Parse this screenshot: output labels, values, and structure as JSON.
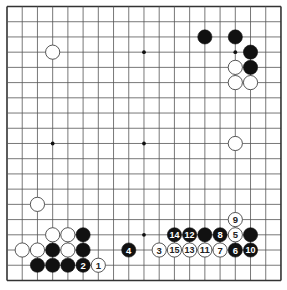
{
  "board": {
    "size": 19,
    "origin_x": 7,
    "origin_y": 6.5,
    "spacing": 15.22,
    "line_color": "#555555",
    "border_color": "#333333",
    "background": "#ffffff",
    "star_points": [
      [
        3,
        3
      ],
      [
        3,
        9
      ],
      [
        3,
        15
      ],
      [
        9,
        3
      ],
      [
        9,
        9
      ],
      [
        9,
        15
      ],
      [
        15,
        3
      ],
      [
        15,
        9
      ],
      [
        15,
        15
      ]
    ]
  },
  "colors": {
    "black_stone": "#111111",
    "white_stone": "#ffffff",
    "white_stroke": "#444444",
    "black_label": "#ffffff",
    "white_label": "#222222"
  },
  "stones": [
    {
      "color": "black",
      "x": 13,
      "y": 2,
      "label": ""
    },
    {
      "color": "black",
      "x": 15,
      "y": 2,
      "label": ""
    },
    {
      "color": "black",
      "x": 16,
      "y": 3,
      "label": ""
    },
    {
      "color": "black",
      "x": 16,
      "y": 4,
      "label": ""
    },
    {
      "color": "white",
      "x": 15,
      "y": 4,
      "label": ""
    },
    {
      "color": "white",
      "x": 15,
      "y": 5,
      "label": ""
    },
    {
      "color": "white",
      "x": 16,
      "y": 5,
      "label": ""
    },
    {
      "color": "white",
      "x": 3,
      "y": 3,
      "label": ""
    },
    {
      "color": "white",
      "x": 15,
      "y": 9,
      "label": ""
    },
    {
      "color": "white",
      "x": 2,
      "y": 13,
      "label": ""
    },
    {
      "color": "white",
      "x": 3,
      "y": 15,
      "label": ""
    },
    {
      "color": "white",
      "x": 4,
      "y": 15,
      "label": ""
    },
    {
      "color": "black",
      "x": 5,
      "y": 15,
      "label": ""
    },
    {
      "color": "white",
      "x": 1,
      "y": 16,
      "label": ""
    },
    {
      "color": "white",
      "x": 2,
      "y": 16,
      "label": ""
    },
    {
      "color": "black",
      "x": 3,
      "y": 16,
      "label": ""
    },
    {
      "color": "white",
      "x": 4,
      "y": 16,
      "label": ""
    },
    {
      "color": "black",
      "x": 5,
      "y": 16,
      "label": ""
    },
    {
      "color": "black",
      "x": 2,
      "y": 17,
      "label": ""
    },
    {
      "color": "black",
      "x": 3,
      "y": 17,
      "label": ""
    },
    {
      "color": "black",
      "x": 4,
      "y": 17,
      "label": ""
    },
    {
      "color": "black",
      "x": 13,
      "y": 15,
      "label": ""
    },
    {
      "color": "black",
      "x": 16,
      "y": 15,
      "label": ""
    },
    {
      "color": "white",
      "x": 6,
      "y": 17,
      "label": "1"
    },
    {
      "color": "black",
      "x": 5,
      "y": 17,
      "label": "2"
    },
    {
      "color": "white",
      "x": 10,
      "y": 16,
      "label": "3"
    },
    {
      "color": "black",
      "x": 8,
      "y": 16,
      "label": "4"
    },
    {
      "color": "white",
      "x": 15,
      "y": 15,
      "label": "5"
    },
    {
      "color": "black",
      "x": 15,
      "y": 16,
      "label": "6"
    },
    {
      "color": "white",
      "x": 14,
      "y": 16,
      "label": "7"
    },
    {
      "color": "black",
      "x": 14,
      "y": 15,
      "label": "8"
    },
    {
      "color": "white",
      "x": 15,
      "y": 14,
      "label": "9"
    },
    {
      "color": "black",
      "x": 16,
      "y": 16,
      "label": "10"
    },
    {
      "color": "white",
      "x": 13,
      "y": 16,
      "label": "11"
    },
    {
      "color": "black",
      "x": 12,
      "y": 15,
      "label": "12"
    },
    {
      "color": "white",
      "x": 12,
      "y": 16,
      "label": "13"
    },
    {
      "color": "black",
      "x": 11,
      "y": 15,
      "label": "14"
    },
    {
      "color": "white",
      "x": 11,
      "y": 16,
      "label": "15"
    }
  ]
}
